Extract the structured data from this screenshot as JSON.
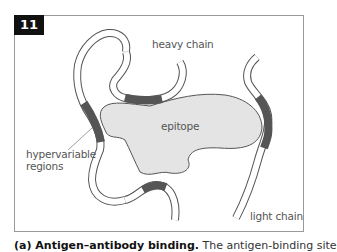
{
  "figure": {
    "number": "11",
    "labels": {
      "heavy_chain": "heavy chain",
      "epitope": "epitope",
      "hypervariable_regions_line1": "hypervariable",
      "hypervariable_regions_line2": "regions",
      "light_chain": "light chain"
    },
    "caption_bold": "(a) Antigen–antibody binding.",
    "caption_rest": " The antigen-binding site"
  },
  "colors": {
    "frame_border": "#9a9a9a",
    "badge_bg": "#111111",
    "chain_outline": "#555555",
    "chain_fill": "#ffffff",
    "hypervariable": "#555555",
    "epitope_fill": "#e4e4e4",
    "epitope_stroke": "#555555",
    "label_text": "#555555"
  }
}
